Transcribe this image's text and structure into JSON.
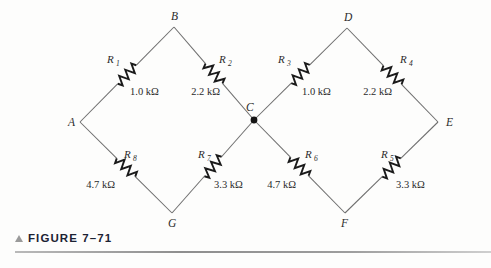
{
  "figure": {
    "caption_marker": "triangle-marker",
    "caption": "FIGURE 7–71",
    "background_color": "#fdfdfc",
    "wire_color": "#6e6e6e",
    "symbol_color": "#1a1a1a",
    "caption_color": "#1c2233"
  },
  "circuit": {
    "type": "two-diamond resistive network",
    "nodes": [
      {
        "id": "A",
        "label": "A",
        "x": 80,
        "y": 122,
        "label_x": 68,
        "label_y": 126,
        "junction": false
      },
      {
        "id": "B",
        "label": "B",
        "x": 174,
        "y": 27,
        "label_x": 171,
        "label_y": 20,
        "junction": false
      },
      {
        "id": "C",
        "label": "C",
        "x": 254,
        "y": 120,
        "label_x": 246,
        "label_y": 111,
        "junction": true
      },
      {
        "id": "D",
        "label": "D",
        "x": 347,
        "y": 28,
        "label_x": 344,
        "label_y": 21,
        "junction": false
      },
      {
        "id": "E",
        "label": "E",
        "x": 438,
        "y": 122,
        "label_x": 446,
        "label_y": 126,
        "junction": false
      },
      {
        "id": "F",
        "label": "F",
        "x": 345,
        "y": 213,
        "label_x": 341,
        "label_y": 227,
        "junction": false
      },
      {
        "id": "G",
        "label": "G",
        "x": 172,
        "y": 213,
        "label_x": 168,
        "label_y": 227,
        "junction": false
      }
    ],
    "resistors": [
      {
        "id": "R1",
        "name": "R",
        "subscript": "1",
        "value": "1.0 kΩ",
        "from": "A",
        "to": "B",
        "name_x": 107,
        "name_y": 63,
        "sub_x": 116,
        "sub_y": 66,
        "value_x": 130,
        "value_y": 95,
        "value_anchor": "start"
      },
      {
        "id": "R2",
        "name": "R",
        "subscript": "2",
        "value": "2.2 kΩ",
        "from": "B",
        "to": "C",
        "name_x": 219,
        "name_y": 63,
        "sub_x": 228,
        "sub_y": 66,
        "value_x": 220,
        "value_y": 95,
        "value_anchor": "end"
      },
      {
        "id": "R3",
        "name": "R",
        "subscript": "3",
        "value": "1.0 kΩ",
        "from": "C",
        "to": "D",
        "name_x": 278,
        "name_y": 63,
        "sub_x": 287,
        "sub_y": 66,
        "value_x": 302,
        "value_y": 95,
        "value_anchor": "start"
      },
      {
        "id": "R4",
        "name": "R",
        "subscript": "4",
        "value": "2.2 kΩ",
        "from": "D",
        "to": "E",
        "name_x": 400,
        "name_y": 63,
        "sub_x": 409,
        "sub_y": 66,
        "value_x": 392,
        "value_y": 95,
        "value_anchor": "end"
      },
      {
        "id": "R5",
        "name": "R",
        "subscript": "5",
        "value": "3.3 kΩ",
        "from": "F",
        "to": "E",
        "name_x": 381,
        "name_y": 158,
        "sub_x": 390,
        "sub_y": 161,
        "value_x": 396,
        "value_y": 188,
        "value_anchor": "start"
      },
      {
        "id": "R6",
        "name": "R",
        "subscript": "6",
        "value": "4.7 kΩ",
        "from": "C",
        "to": "F",
        "name_x": 305,
        "name_y": 158,
        "sub_x": 314,
        "sub_y": 161,
        "value_x": 296,
        "value_y": 188,
        "value_anchor": "end"
      },
      {
        "id": "R7",
        "name": "R",
        "subscript": "7",
        "value": "3.3 kΩ",
        "from": "G",
        "to": "C",
        "name_x": 198,
        "name_y": 158,
        "sub_x": 207,
        "sub_y": 161,
        "value_x": 214,
        "value_y": 188,
        "value_anchor": "start"
      },
      {
        "id": "R8",
        "name": "R",
        "subscript": "8",
        "value": "4.7 kΩ",
        "from": "A",
        "to": "G",
        "name_x": 124,
        "name_y": 158,
        "sub_x": 133,
        "sub_y": 161,
        "value_x": 115,
        "value_y": 188,
        "value_anchor": "end"
      }
    ]
  }
}
